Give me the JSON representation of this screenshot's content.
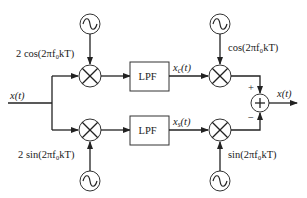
{
  "diagram": {
    "title": "",
    "input": {
      "label": "x(t)"
    },
    "output": {
      "label": "x(t)"
    },
    "upper_branch": {
      "oscillator_left_label": "2 cos(2πf₀kT)",
      "filter_label": "LPF",
      "filter_output_label": "x_c(t)",
      "oscillator_right_label": "cos(2πf₀kT)",
      "summer_sign": "+"
    },
    "lower_branch": {
      "oscillator_left_label": "2 sin(2πf₀kT)",
      "filter_label": "LPF",
      "filter_output_label": "x_s(t)",
      "oscillator_right_label": "sin(2πf₀kT)",
      "summer_sign": "−"
    },
    "summer_symbol": "+",
    "colors": {
      "line": "#222222",
      "background": "#ffffff"
    }
  }
}
